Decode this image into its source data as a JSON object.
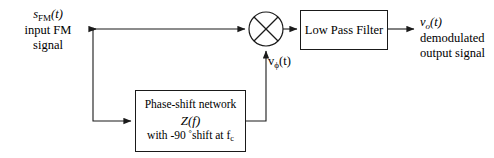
{
  "diagram": {
    "background_color": "#ffffff",
    "line_color": "#1a1a1a"
  },
  "input": {
    "signal_symbol": "s",
    "signal_subscript": "FM",
    "signal_arg": "(t)",
    "signal_full": "sFM(t)",
    "description_line1": "input FM",
    "description_line2": "signal"
  },
  "multiplier": {
    "name": "multiplier",
    "glyph": "⊗",
    "label": "X"
  },
  "quadrature_signal": {
    "symbol": "v",
    "subscript": "ϕ",
    "arg": "(t)",
    "full": "vϕ(t)"
  },
  "lpf": {
    "label": "Low Pass Filter"
  },
  "phase_shift_network": {
    "line1": "Phase-shift network",
    "line2": "Z(f)",
    "line3_prefix": "with -90 ",
    "line3_degree": "°",
    "line3_mid": "shift at f",
    "line3_subscript": "c",
    "line3_full": "with -90 °shift at fc"
  },
  "output": {
    "signal_symbol": "v",
    "signal_subscript": "o",
    "signal_arg": "(t)",
    "signal_full": "vo(t)",
    "description_line1": "demodulated",
    "description_line2": "output signal"
  }
}
